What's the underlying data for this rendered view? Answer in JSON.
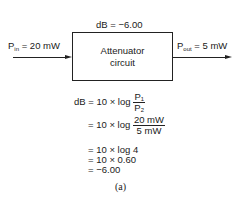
{
  "diagram": {
    "gain_label": "dB = −6.00",
    "box": {
      "line1": "Attenuator",
      "line2": "circuit"
    },
    "input": {
      "symbol": "P",
      "subscript": "in",
      "value": " = 20 mW"
    },
    "output": {
      "symbol": "P",
      "subscript": "out",
      "value": " = 5 mW"
    }
  },
  "equations": {
    "line1": {
      "prefix": "dB = 10 × log ",
      "num": "P₁",
      "den": "P₂"
    },
    "line2": {
      "prefix": "= 10 × log ",
      "num": "20 mW",
      "den": "5 mW"
    },
    "line3": "= 10 × log 4",
    "line4": "= 10 × 0.60",
    "line5": "= −6.00"
  },
  "caption": "(a)"
}
